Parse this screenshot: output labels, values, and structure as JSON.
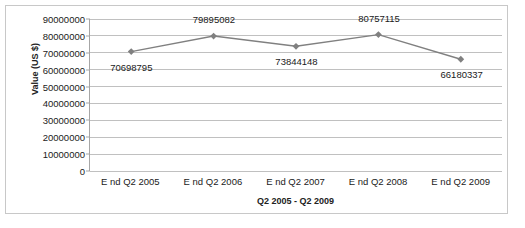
{
  "chart_data": {
    "type": "line",
    "title": "",
    "xlabel": "Q2 2005 - Q2 2009",
    "ylabel": "Value (US $)",
    "categories": [
      "E nd Q2 2005",
      "E nd Q2 2006",
      "E nd Q2 2007",
      "E nd Q2 2008",
      "E nd Q2 2009"
    ],
    "values": [
      70698795,
      79895082,
      73844148,
      80757115,
      66180337
    ],
    "data_labels": [
      "70698795",
      "79895082",
      "73844148",
      "80757115",
      "66180337"
    ],
    "data_label_positions": [
      "below",
      "above",
      "below",
      "above",
      "below"
    ],
    "ylim": [
      0,
      90000000
    ],
    "ytick_values": [
      0,
      10000000,
      20000000,
      30000000,
      40000000,
      50000000,
      60000000,
      70000000,
      80000000,
      90000000
    ],
    "ytick_labels": [
      "0",
      "10000000",
      "20000000",
      "30000000",
      "40000000",
      "50000000",
      "60000000",
      "70000000",
      "80000000",
      "90000000"
    ],
    "grid": true,
    "legend": false,
    "marker": "diamond",
    "series_color": "#808080",
    "gridline_color": "#c0c0c0",
    "axis_color": "#a6a6a6",
    "text_color": "#1a1a1a",
    "background_color": "#ffffff",
    "border_color": "#c8c8c8"
  }
}
